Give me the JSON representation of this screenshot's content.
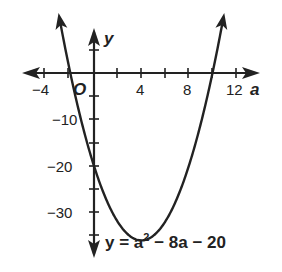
{
  "chart_data": {
    "type": "line",
    "title": "",
    "xlabel": "a",
    "ylabel": "y",
    "origin_label": "O",
    "equation": "y = a² − 8a − 20",
    "equation_parts": {
      "lhs": "y = a",
      "exp": "2",
      "rhs": " − 8a − 20"
    },
    "x_ticks": [
      -4,
      4,
      8,
      12
    ],
    "x_tick_labels": [
      "−4",
      "4",
      "8",
      "12"
    ],
    "y_ticks": [
      -10,
      -20,
      -30
    ],
    "y_tick_labels": [
      "−10",
      "−20",
      "−30"
    ],
    "xlim": [
      -5.5,
      13.5
    ],
    "ylim": [
      -40,
      7
    ],
    "grid": false,
    "series": [
      {
        "name": "y = a^2 - 8a - 20",
        "x": [
          -3,
          -2,
          -1,
          0,
          1,
          2,
          3,
          4,
          5,
          6,
          7,
          8,
          9,
          10,
          11
        ],
        "values": [
          13,
          0,
          -11,
          -20,
          -27,
          -32,
          -35,
          -36,
          -35,
          -32,
          -27,
          -20,
          -11,
          0,
          13
        ]
      }
    ],
    "vertex": [
      4,
      -36
    ],
    "roots": [
      -2,
      10
    ],
    "y_intercept": -20
  }
}
